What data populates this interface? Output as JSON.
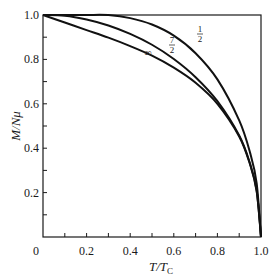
{
  "chart_data": {
    "type": "line",
    "title": "",
    "xlabel": "T/T_C",
    "ylabel": "M/Nμ",
    "xlim": [
      0,
      1.0
    ],
    "ylim": [
      0,
      1.0
    ],
    "grid": false,
    "legend": "inline curve labels",
    "x_ticks": [
      "0",
      "0.2",
      "0.4",
      "0.6",
      "0.8",
      "1.0"
    ],
    "y_ticks": [
      "0.2",
      "0.4",
      "0.6",
      "0.8",
      "1.0"
    ],
    "x": [
      0,
      0.1,
      0.2,
      0.3,
      0.4,
      0.5,
      0.6,
      0.7,
      0.8,
      0.9,
      0.95,
      0.98,
      1.0
    ],
    "series": [
      {
        "name": "1/2",
        "label": "½",
        "values": [
          1.0,
          1.0,
          1.0,
          0.9995,
          0.986,
          0.957,
          0.907,
          0.828,
          0.71,
          0.525,
          0.379,
          0.243,
          0.0
        ]
      },
      {
        "name": "7/2",
        "label": "7/2",
        "values": [
          1.0,
          0.997,
          0.98,
          0.953,
          0.915,
          0.866,
          0.802,
          0.72,
          0.612,
          0.457,
          0.33,
          0.21,
          0.0
        ]
      },
      {
        "name": "∞",
        "label": "∞",
        "values": [
          1.0,
          0.966,
          0.932,
          0.898,
          0.86,
          0.817,
          0.763,
          0.695,
          0.6,
          0.453,
          0.326,
          0.207,
          0.0
        ]
      }
    ],
    "annotations": [
      {
        "text": "½",
        "x": 0.72,
        "y": 0.93
      },
      {
        "text": "7/2",
        "x": 0.6,
        "y": 0.88
      },
      {
        "text": "∞",
        "x": 0.49,
        "y": 0.83
      }
    ]
  },
  "labels": {
    "xlabel_T": "T",
    "xlabel_slash": "/",
    "xlabel_Tc": "T",
    "xlabel_sub": "C",
    "ylabel": "M/Nμ",
    "origin": "0",
    "curve_half_num": "1",
    "curve_half_den": "2",
    "curve_sevenhalf_num": "7",
    "curve_sevenhalf_den": "2",
    "curve_inf": "∞"
  },
  "colors": {
    "line": "#111111",
    "axis": "#1a1a1a",
    "background": "#ffffff"
  }
}
